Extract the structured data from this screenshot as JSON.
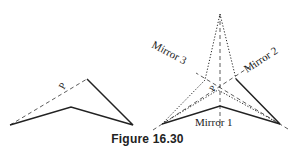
{
  "figure": {
    "caption": "Figure 16.30",
    "left_panel": {
      "point_label": "P",
      "solid_path": [
        [
          10,
          125
        ],
        [
          71,
          107
        ],
        [
          133,
          125
        ],
        [
          87,
          79
        ]
      ],
      "dashed_line": [
        [
          10,
          125
        ],
        [
          87,
          79
        ]
      ]
    },
    "right_panel": {
      "point_label": "P",
      "mirrors": [
        {
          "label": "Mirror 1",
          "line": [
            [
              220,
              14
            ],
            [
              220,
              128
            ]
          ]
        },
        {
          "label": "Mirror 2",
          "line": [
            [
              153,
              130
            ],
            [
              254,
              64
            ]
          ]
        },
        {
          "label": "Mirror 3",
          "line": [
            [
              288,
              129
            ],
            [
              196,
              73
            ]
          ]
        }
      ],
      "solid_path": [
        [
          162,
          124
        ],
        [
          220,
          106
        ],
        [
          280,
          124
        ],
        [
          236,
          79
        ]
      ],
      "dotted_paths": [
        [
          [
            162,
            124
          ],
          [
            205,
            80
          ],
          [
            220,
            14
          ],
          [
            236,
            79
          ]
        ],
        [
          [
            162,
            124
          ],
          [
            218,
            90
          ],
          [
            280,
            124
          ]
        ]
      ]
    },
    "colors": {
      "ink": "#222222",
      "background": "#ffffff"
    }
  }
}
